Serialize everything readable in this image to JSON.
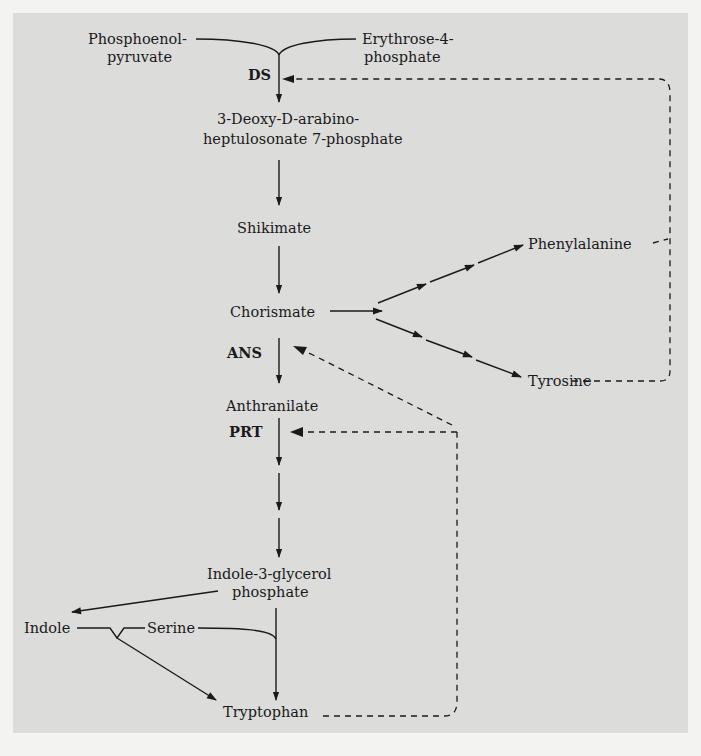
{
  "diagram": {
    "type": "metabolic-pathway",
    "metabolites": {
      "pep_line1": "Phosphoenol-",
      "pep_line2": "pyruvate",
      "e4p_line1": "Erythrose-4-",
      "e4p_line2": "phosphate",
      "dahp_line1": "3-Deoxy-D-arabino-",
      "dahp_line2": "heptulosonate 7-phosphate",
      "shikimate": "Shikimate",
      "chorismate": "Chorismate",
      "phenylalanine": "Phenylalanine",
      "tyrosine": "Tyrosine",
      "anthranilate": "Anthranilate",
      "igp_line1": "Indole-3-glycerol",
      "igp_line2": "phosphate",
      "indole": "Indole",
      "serine": "Serine",
      "tryptophan": "Tryptophan"
    },
    "enzymes": {
      "ds": "DS",
      "ans": "ANS",
      "prt": "PRT"
    },
    "feedback": [
      {
        "from": "Phenylalanine",
        "to": "DS"
      },
      {
        "from": "Tyrosine",
        "to": "DS"
      },
      {
        "from": "Tryptophan",
        "to": "ANS"
      },
      {
        "from": "Tryptophan",
        "to": "PRT"
      }
    ],
    "colors": {
      "background": "#f3f3f1",
      "panel": "#dcdcda",
      "ink": "#1a1a1a"
    }
  }
}
